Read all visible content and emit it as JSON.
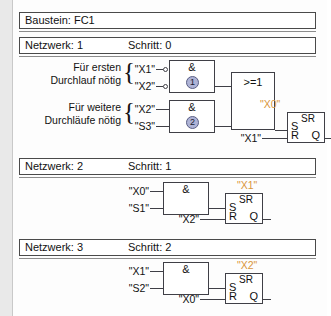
{
  "block_header": {
    "label": "Baustein: FC1"
  },
  "networks": [
    {
      "id": "network-1",
      "network_label": "Netzwerk: 1",
      "step_label": "Schritt: 0",
      "annotations": [
        {
          "line1": "Für ersten",
          "line2": "Durchlauf nötig"
        },
        {
          "line1": "Für weitere",
          "line2": "Durchläufe nötig"
        }
      ],
      "gates": [
        {
          "name": "and-gate-1",
          "symbol": "&",
          "number": "1",
          "inputs": [
            {
              "operand": "\"X1\"",
              "negated": true
            },
            {
              "operand": "\"X2\"",
              "negated": true
            }
          ]
        },
        {
          "name": "and-gate-2",
          "symbol": "&",
          "number": "2",
          "inputs": [
            {
              "operand": "\"X2\"",
              "negated": false
            },
            {
              "operand": "\"S3\"",
              "negated": false
            }
          ]
        },
        {
          "name": "or-gate-1",
          "symbol": ">=1",
          "number": "",
          "inputs": []
        }
      ],
      "flipflop": {
        "name": "sr-flipflop-1",
        "title": "SR",
        "output_operand": "\"X0\"",
        "pin_s": "S",
        "pin_r": "R",
        "pin_q": "Q",
        "reset_operand": "\"X1\""
      }
    },
    {
      "id": "network-2",
      "network_label": "Netzwerk: 2",
      "step_label": "Schritt: 1",
      "annotations": [],
      "gates": [
        {
          "name": "and-gate-3",
          "symbol": "&",
          "number": "",
          "inputs": [
            {
              "operand": "\"X0\"",
              "negated": false
            },
            {
              "operand": "\"S1\"",
              "negated": false
            }
          ]
        }
      ],
      "flipflop": {
        "name": "sr-flipflop-2",
        "title": "SR",
        "output_operand": "\"X1\"",
        "pin_s": "S",
        "pin_r": "R",
        "pin_q": "Q",
        "reset_operand": "\"X2\""
      }
    },
    {
      "id": "network-3",
      "network_label": "Netzwerk: 3",
      "step_label": "Schritt: 2",
      "annotations": [],
      "gates": [
        {
          "name": "and-gate-4",
          "symbol": "&",
          "number": "",
          "inputs": [
            {
              "operand": "\"X1\"",
              "negated": false
            },
            {
              "operand": "\"S2\"",
              "negated": false
            }
          ]
        }
      ],
      "flipflop": {
        "name": "sr-flipflop-3",
        "title": "SR",
        "output_operand": "\"X2\"",
        "pin_s": "S",
        "pin_r": "R",
        "pin_q": "Q",
        "reset_operand": "\"X0\""
      }
    }
  ],
  "colors": {
    "operand_output": "#d9963c",
    "line": "#3f3f46",
    "page_background": "#e9e9e9",
    "panel_background": "#fdfdfd"
  },
  "brace_glyph": "{"
}
